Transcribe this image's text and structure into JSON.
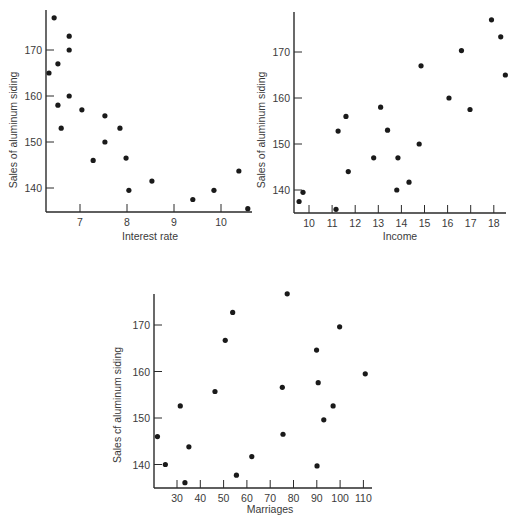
{
  "chart_data": [
    {
      "type": "scatter",
      "title": "",
      "xlabel": "Interest rate",
      "ylabel": "Sales of aluminum siding",
      "xlim": [
        6.3,
        10.65
      ],
      "ylim": [
        134.5,
        179
      ],
      "xticks": [
        7,
        8,
        9,
        10
      ],
      "yticks": [
        140,
        150,
        160,
        170
      ],
      "grid": false,
      "legend": null,
      "points": [
        {
          "x": 6.45,
          "y": 177
        },
        {
          "x": 6.77,
          "y": 173
        },
        {
          "x": 6.34,
          "y": 165
        },
        {
          "x": 6.53,
          "y": 167
        },
        {
          "x": 6.53,
          "y": 158
        },
        {
          "x": 6.6,
          "y": 153
        },
        {
          "x": 6.77,
          "y": 160
        },
        {
          "x": 6.77,
          "y": 170
        },
        {
          "x": 7.04,
          "y": 157
        },
        {
          "x": 7.53,
          "y": 155.7
        },
        {
          "x": 7.28,
          "y": 146
        },
        {
          "x": 7.53,
          "y": 150
        },
        {
          "x": 7.85,
          "y": 153
        },
        {
          "x": 7.98,
          "y": 146.5
        },
        {
          "x": 8.04,
          "y": 139.5
        },
        {
          "x": 8.53,
          "y": 141.5
        },
        {
          "x": 9.4,
          "y": 137.5
        },
        {
          "x": 9.85,
          "y": 139.5
        },
        {
          "x": 10.38,
          "y": 143.7
        },
        {
          "x": 10.57,
          "y": 135.5
        }
      ]
    },
    {
      "type": "scatter",
      "title": "",
      "xlabel": "Income",
      "ylabel": "Sales of aluminum siding",
      "xlim": [
        9.35,
        18.55
      ],
      "ylim": [
        134.5,
        179
      ],
      "xticks": [
        10,
        11,
        12,
        13,
        14,
        15,
        16,
        17,
        18
      ],
      "yticks": [
        140,
        150,
        160,
        170
      ],
      "grid": false,
      "legend": null,
      "points": [
        {
          "x": 9.57,
          "y": 137.5
        },
        {
          "x": 9.74,
          "y": 139.5
        },
        {
          "x": 11.17,
          "y": 135.8
        },
        {
          "x": 11.26,
          "y": 152.8
        },
        {
          "x": 11.6,
          "y": 156
        },
        {
          "x": 11.7,
          "y": 144
        },
        {
          "x": 12.8,
          "y": 147
        },
        {
          "x": 13.1,
          "y": 158
        },
        {
          "x": 13.4,
          "y": 153
        },
        {
          "x": 13.8,
          "y": 140
        },
        {
          "x": 13.85,
          "y": 147
        },
        {
          "x": 14.33,
          "y": 141.7
        },
        {
          "x": 14.77,
          "y": 150
        },
        {
          "x": 14.85,
          "y": 167
        },
        {
          "x": 16.06,
          "y": 160
        },
        {
          "x": 16.6,
          "y": 170.3
        },
        {
          "x": 16.97,
          "y": 157.5
        },
        {
          "x": 17.9,
          "y": 177
        },
        {
          "x": 18.3,
          "y": 173.3
        },
        {
          "x": 18.5,
          "y": 165
        }
      ]
    },
    {
      "type": "scatter",
      "title": "",
      "xlabel": "Marriages",
      "ylabel": "Sales cf aluminum siding",
      "xlim": [
        20,
        114
      ],
      "ylim": [
        135,
        180
      ],
      "xticks": [
        30,
        40,
        50,
        60,
        70,
        80,
        90,
        100,
        110
      ],
      "yticks": [
        140,
        150,
        160,
        170
      ],
      "grid": false,
      "legend": null,
      "points": [
        {
          "x": 21.6,
          "y": 146
        },
        {
          "x": 25,
          "y": 140
        },
        {
          "x": 31.4,
          "y": 152.6
        },
        {
          "x": 35.1,
          "y": 143.8
        },
        {
          "x": 33.4,
          "y": 136.1
        },
        {
          "x": 46.3,
          "y": 155.7
        },
        {
          "x": 50.7,
          "y": 166.7
        },
        {
          "x": 53.9,
          "y": 172.7
        },
        {
          "x": 55.5,
          "y": 137.7
        },
        {
          "x": 62.1,
          "y": 141.7
        },
        {
          "x": 77.3,
          "y": 176.7
        },
        {
          "x": 99.8,
          "y": 169.6
        },
        {
          "x": 89.9,
          "y": 164.6
        },
        {
          "x": 110.8,
          "y": 159.5
        },
        {
          "x": 75.2,
          "y": 156.6
        },
        {
          "x": 90.6,
          "y": 157.6
        },
        {
          "x": 97,
          "y": 152.6
        },
        {
          "x": 93,
          "y": 149.6
        },
        {
          "x": 75.5,
          "y": 146.5
        },
        {
          "x": 90.1,
          "y": 139.7
        }
      ]
    }
  ],
  "style": {
    "ink_color": "#1a1a1a",
    "axis_color": "#2a2a2a",
    "background": "#ffffff"
  }
}
